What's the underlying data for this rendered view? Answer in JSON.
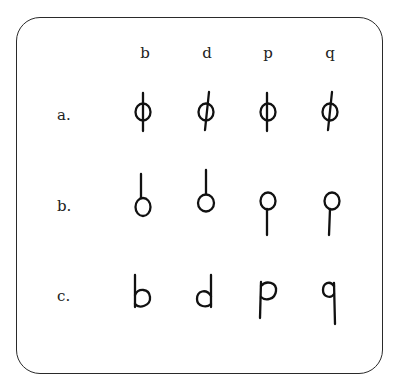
{
  "figure": {
    "columns": [
      "b",
      "d",
      "p",
      "q"
    ],
    "rows": [
      {
        "label": "a.",
        "variant": "circle-crossed-by-stem",
        "glyphs": [
          "b",
          "d",
          "p",
          "q"
        ]
      },
      {
        "label": "b.",
        "variant": "circle-with-detached-stem",
        "glyphs": [
          "b",
          "d",
          "p",
          "q"
        ]
      },
      {
        "label": "c.",
        "variant": "handwritten-letter",
        "glyphs": [
          "b",
          "d",
          "p",
          "q"
        ]
      }
    ]
  }
}
